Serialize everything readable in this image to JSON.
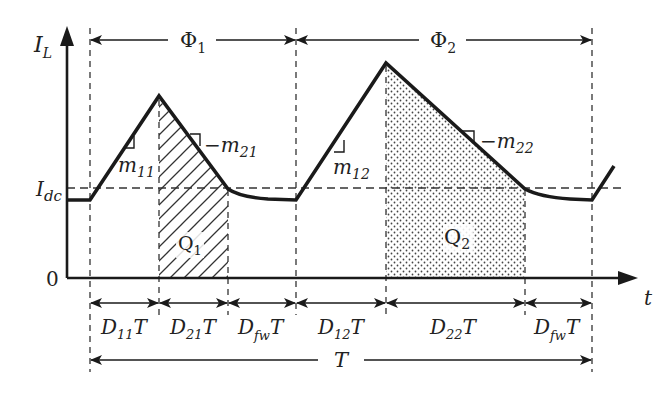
{
  "diagram": {
    "axes": {
      "y_label_main": "I",
      "y_label_sub": "L",
      "x_label": "t",
      "origin_label": "0",
      "idc_label_main": "I",
      "idc_label_sub": "dc"
    },
    "phases": [
      {
        "main": "Φ",
        "sub": "1"
      },
      {
        "main": "Φ",
        "sub": "2"
      }
    ],
    "slopes": [
      {
        "prefix": "",
        "main": "m",
        "sub": "11"
      },
      {
        "prefix": "−",
        "main": "m",
        "sub": "21"
      },
      {
        "prefix": "",
        "main": "m",
        "sub": "12"
      },
      {
        "prefix": "−",
        "main": "m",
        "sub": "22"
      }
    ],
    "charges": [
      {
        "main": "Q",
        "sub": "1",
        "fill": "hatched"
      },
      {
        "main": "Q",
        "sub": "2",
        "fill": "dotted"
      }
    ],
    "durations": [
      {
        "main": "D",
        "sub": "11",
        "suffix": "T"
      },
      {
        "main": "D",
        "sub": "21",
        "suffix": "T"
      },
      {
        "main": "D",
        "sub": "fw",
        "suffix": "T"
      },
      {
        "main": "D",
        "sub": "12",
        "suffix": "T"
      },
      {
        "main": "D",
        "sub": "22",
        "suffix": "T"
      },
      {
        "main": "D",
        "sub": "fw",
        "suffix": "T"
      }
    ],
    "period_label": "T",
    "colors": {
      "line": "#1a1a1a",
      "dashed": "#333333",
      "background": "#ffffff"
    }
  }
}
